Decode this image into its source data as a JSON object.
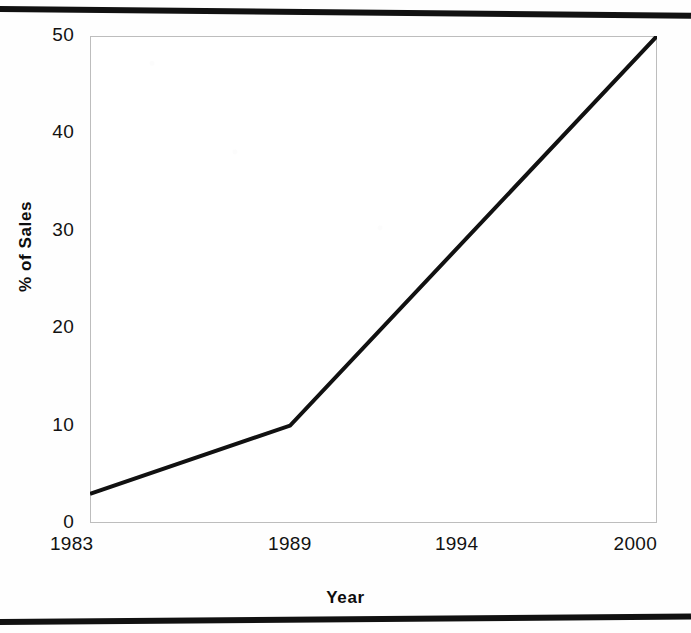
{
  "chart_data": {
    "type": "line",
    "title": "",
    "subtitle": "",
    "xlabel": "Year",
    "ylabel": "% of Sales",
    "x": [
      1983,
      1989,
      2000
    ],
    "values": [
      3,
      10,
      50
    ],
    "series": [
      {
        "name": "% of Sales",
        "x": [
          1983,
          1989,
          2000
        ],
        "values": [
          3,
          10,
          50
        ],
        "color": "#111111"
      }
    ],
    "xlim": [
      1983,
      2000
    ],
    "ylim": [
      0,
      50
    ],
    "x_tick_labels": [
      "1983",
      "1989",
      "1994",
      "2000"
    ],
    "x_tick_values": [
      1983,
      1989,
      1994,
      2000
    ],
    "y_tick_labels": [
      "0",
      "10",
      "20",
      "30",
      "40",
      "50"
    ],
    "y_tick_values": [
      0,
      10,
      20,
      30,
      40,
      50
    ],
    "grid": false,
    "legend": false,
    "legend_position": "none",
    "annotations": [],
    "plot_border_color": "#bdbdbd",
    "plot_background": "#ffffff",
    "line_width_px": 4
  },
  "axes": {
    "y_title": "% of Sales",
    "x_title": "Year",
    "y_ticks": [
      {
        "label": "50",
        "value": 50
      },
      {
        "label": "40",
        "value": 40
      },
      {
        "label": "30",
        "value": 30
      },
      {
        "label": "20",
        "value": 20
      },
      {
        "label": "10",
        "value": 10
      },
      {
        "label": "0",
        "value": 0
      }
    ],
    "x_ticks": [
      {
        "label": "1983",
        "value": 1983
      },
      {
        "label": "1989",
        "value": 1989
      },
      {
        "label": "1994",
        "value": 1994
      },
      {
        "label": "2000",
        "value": 2000
      }
    ]
  },
  "style": {
    "ink_color": "#111111",
    "page_color": "#fefefe",
    "rule_color": "#111111"
  }
}
